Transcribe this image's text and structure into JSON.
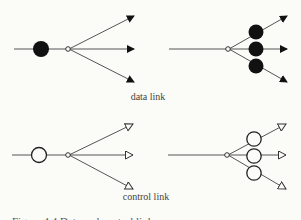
{
  "diagram": {
    "panels": [
      {
        "id": "data-single",
        "kind": "data",
        "node_count": 1,
        "outputs": 3
      },
      {
        "id": "data-multi",
        "kind": "data",
        "node_count": 3,
        "outputs": 3
      },
      {
        "id": "control-single",
        "kind": "control",
        "node_count": 1,
        "outputs": 3
      },
      {
        "id": "control-multi",
        "kind": "control",
        "node_count": 3,
        "outputs": 3
      }
    ],
    "labels": {
      "data_link": "data link",
      "control_link": "control link"
    },
    "caption": "Figure 4.4  Data and control links",
    "colors": {
      "ink": "#2a2a2a",
      "fill": "#111111",
      "line": "#555555",
      "background": "#fbfbf8"
    }
  }
}
